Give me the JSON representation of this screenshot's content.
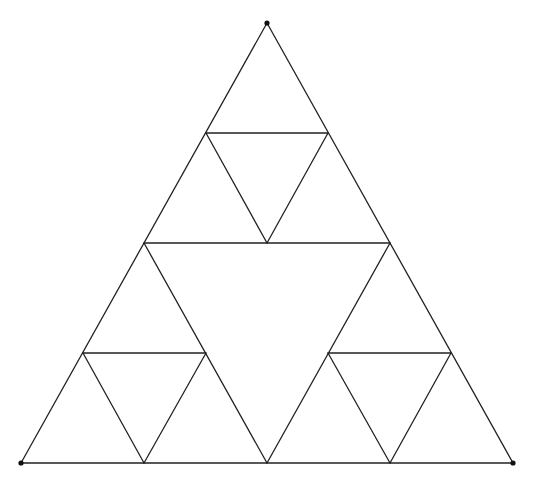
{
  "diagram": {
    "type": "sierpinski-triangle",
    "level": 2,
    "stroke_color": "#222222",
    "background": "#ffffff",
    "vertices": {
      "top": [
        267,
        23
      ],
      "bottom_left": [
        21,
        463
      ],
      "bottom_right": [
        513,
        463
      ]
    },
    "vertex_points": [
      [
        267,
        23
      ],
      [
        21,
        463
      ],
      [
        513,
        463
      ]
    ],
    "segments": [
      [
        267,
        23,
        21,
        463
      ],
      [
        267,
        23,
        513,
        463
      ],
      [
        21,
        463,
        513,
        463
      ],
      [
        144,
        243,
        390,
        243
      ],
      [
        144,
        243,
        267,
        463
      ],
      [
        390,
        243,
        267,
        463
      ],
      [
        206,
        133,
        328,
        133
      ],
      [
        206,
        133,
        267,
        243
      ],
      [
        328,
        133,
        267,
        243
      ],
      [
        83,
        353,
        206,
        353
      ],
      [
        83,
        353,
        144,
        463
      ],
      [
        206,
        353,
        144,
        463
      ],
      [
        328,
        353,
        451,
        353
      ],
      [
        328,
        353,
        390,
        463
      ],
      [
        451,
        353,
        390,
        463
      ]
    ]
  }
}
